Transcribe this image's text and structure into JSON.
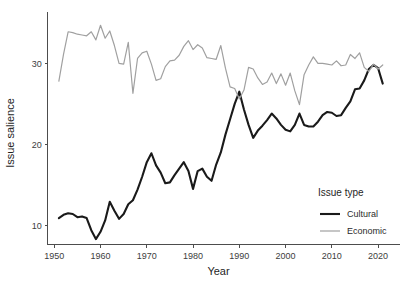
{
  "chart_data": {
    "type": "line",
    "title": "",
    "xlabel": "Year",
    "ylabel": "Issue salience",
    "xlim": [
      1948,
      2023
    ],
    "ylim": [
      7.2,
      35.6
    ],
    "xticks": [
      1950,
      1960,
      1970,
      1980,
      1990,
      2000,
      2010,
      2020
    ],
    "xtick_labels": [
      "1950",
      "1960",
      "1970",
      "1980",
      "1990",
      "2000",
      "2010",
      "2020"
    ],
    "yticks": [
      10,
      20,
      30
    ],
    "ytick_labels": [
      "10",
      "20",
      "30"
    ],
    "grid": false,
    "legend_position": "inside-bottom-right",
    "legend_title": "Issue type",
    "x": [
      1951,
      1952,
      1953,
      1954,
      1955,
      1956,
      1957,
      1958,
      1959,
      1960,
      1961,
      1962,
      1963,
      1964,
      1965,
      1966,
      1967,
      1968,
      1969,
      1970,
      1971,
      1972,
      1973,
      1974,
      1975,
      1976,
      1977,
      1978,
      1979,
      1980,
      1981,
      1982,
      1983,
      1984,
      1985,
      1986,
      1987,
      1988,
      1989,
      1990,
      1991,
      1992,
      1993,
      1994,
      1995,
      1996,
      1997,
      1998,
      1999,
      2000,
      2001,
      2002,
      2003,
      2004,
      2005,
      2006,
      2007,
      2008,
      2009,
      2010,
      2011,
      2012,
      2013,
      2014,
      2015,
      2016,
      2017,
      2018,
      2019,
      2020,
      2021
    ],
    "series": [
      {
        "name": "Cultural",
        "color": "#1a1a1a",
        "width": 2.1,
        "values": [
          10.9,
          11.3,
          11.5,
          11.4,
          11.0,
          11.1,
          10.9,
          9.4,
          8.3,
          9.2,
          10.6,
          12.9,
          11.8,
          10.8,
          11.4,
          12.6,
          13.1,
          14.4,
          16.0,
          17.8,
          18.9,
          17.4,
          16.5,
          15.2,
          15.3,
          16.2,
          17.0,
          17.8,
          16.7,
          14.5,
          16.7,
          17.0,
          16.0,
          15.5,
          17.5,
          19.0,
          21.2,
          23.1,
          25.0,
          26.5,
          24.3,
          22.4,
          20.8,
          21.7,
          22.3,
          23.0,
          23.8,
          23.2,
          22.4,
          21.8,
          21.6,
          22.4,
          23.8,
          22.4,
          22.2,
          22.2,
          22.8,
          23.6,
          24.0,
          23.9,
          23.5,
          23.6,
          24.5,
          25.3,
          26.8,
          26.9,
          27.9,
          29.3,
          29.8,
          29.4,
          27.5
        ]
      },
      {
        "name": "Economic",
        "color": "#a0a0a0",
        "width": 1.2,
        "values": [
          27.8,
          31.1,
          33.9,
          33.8,
          33.6,
          33.5,
          33.4,
          33.9,
          32.9,
          34.7,
          33.1,
          34.0,
          32.2,
          30.0,
          29.9,
          32.6,
          26.3,
          30.6,
          31.3,
          31.5,
          29.9,
          27.9,
          28.1,
          29.6,
          30.3,
          30.4,
          31.0,
          32.1,
          32.8,
          31.7,
          32.3,
          31.9,
          30.7,
          30.6,
          30.5,
          32.2,
          29.4,
          27.1,
          26.9,
          25.6,
          26.7,
          29.5,
          29.3,
          28.2,
          27.4,
          27.7,
          28.8,
          27.5,
          28.7,
          27.3,
          28.8,
          26.6,
          24.9,
          28.6,
          29.8,
          30.8,
          30.0,
          30.0,
          29.9,
          29.8,
          30.3,
          29.7,
          29.8,
          31.1,
          30.6,
          31.3,
          29.5,
          29.0,
          29.9,
          29.3,
          29.8
        ]
      }
    ]
  },
  "legend": {
    "title": "Issue type",
    "items": [
      {
        "label": "Cultural",
        "color": "#1a1a1a"
      },
      {
        "label": "Economic",
        "color": "#a0a0a0"
      }
    ]
  },
  "axes": {
    "x_title": "Year",
    "y_title": "Issue salience"
  }
}
